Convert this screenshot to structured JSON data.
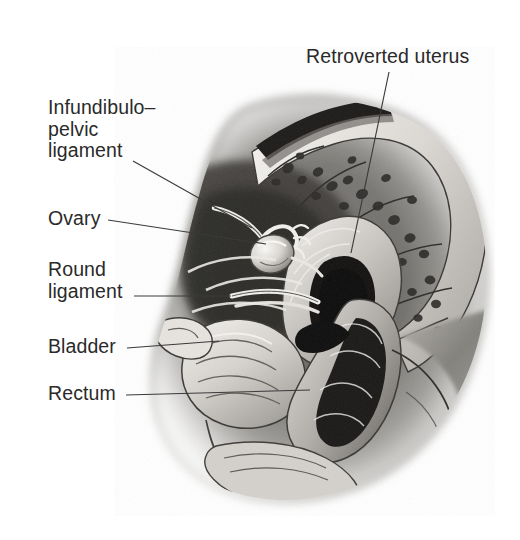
{
  "figure": {
    "title_present": false,
    "frame": {
      "x": 23,
      "y": 19,
      "width": 474,
      "height": 499,
      "border_color": "#2b2b2b"
    },
    "background_color": "#ffffff",
    "text_color": "#2a2a2a",
    "illustration_type": "grayscale-anatomical-drawing"
  },
  "labels": [
    {
      "id": "retroverted-uterus",
      "text": "Retroverted uterus",
      "lines": [
        "Retroverted uterus"
      ],
      "x": 306,
      "y": 46,
      "align": "left",
      "leader": {
        "from": [
          389,
          72
        ],
        "to": [
          351,
          253
        ]
      }
    },
    {
      "id": "infundibulo-pelvic-ligament",
      "text": "Infundibulo-pelvic ligament",
      "lines": [
        "Infundibulo–",
        "pelvic",
        "ligament"
      ],
      "x": 48,
      "y": 97,
      "align": "left",
      "leader": {
        "from": [
          133,
          161
        ],
        "to": [
          252,
          228
        ]
      }
    },
    {
      "id": "ovary",
      "text": "Ovary",
      "lines": [
        "Ovary"
      ],
      "x": 48,
      "y": 208,
      "align": "left",
      "leader": {
        "from": [
          108,
          220
        ],
        "to": [
          266,
          244
        ]
      }
    },
    {
      "id": "round-ligament",
      "text": "Round ligament",
      "lines": [
        "Round",
        "ligament"
      ],
      "x": 48,
      "y": 259,
      "align": "left",
      "leader": {
        "from": [
          134,
          296
        ],
        "to": [
          231,
          296
        ]
      }
    },
    {
      "id": "bladder",
      "text": "Bladder",
      "lines": [
        "Bladder"
      ],
      "x": 48,
      "y": 336,
      "align": "left",
      "leader": {
        "from": [
          127,
          348
        ],
        "to": [
          219,
          341
        ]
      }
    },
    {
      "id": "rectum",
      "text": "Rectum",
      "lines": [
        "Rectum"
      ],
      "x": 48,
      "y": 383,
      "align": "left",
      "leader": {
        "from": [
          126,
          395
        ],
        "to": [
          310,
          390
        ]
      }
    }
  ],
  "palette": {
    "ink": "#2a2a2a",
    "leader_line": "#3a3a3a",
    "tissue_light": "#e9e7e4",
    "tissue_mid": "#9a9894",
    "tissue_dark": "#4a4846",
    "cavity_black": "#151515",
    "bone_white": "#f2f0ed"
  }
}
